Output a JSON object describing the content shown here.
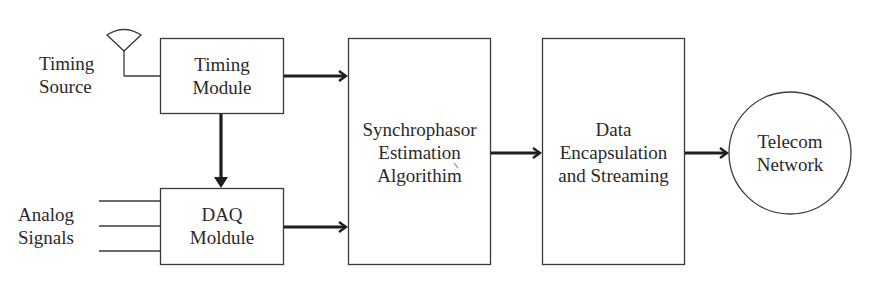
{
  "diagram": {
    "type": "block-diagram",
    "colors": {
      "line": "#3a3a3a",
      "arrow": "#1e1e1e",
      "text": "#2a2a2a",
      "background": "#ffffff"
    },
    "inputs": {
      "timing_source": {
        "lines": [
          "Timing",
          "Source"
        ],
        "icon": "antenna-icon"
      },
      "analog_signals": {
        "lines": [
          "Analog",
          "Signals"
        ],
        "signal_count": 3
      }
    },
    "blocks": {
      "timing_module": {
        "lines": [
          "Timing",
          "Module"
        ],
        "shape": "rectangle"
      },
      "daq_module": {
        "lines": [
          "DAQ",
          "Moldule"
        ],
        "shape": "rectangle"
      },
      "synchrophasor": {
        "lines": [
          "Synchrophasor",
          "Estimation",
          "Algorithim"
        ],
        "shape": "rectangle"
      },
      "data_encapsulation": {
        "lines": [
          "Data",
          "Encapsulation",
          "and Streaming"
        ],
        "shape": "rectangle"
      },
      "telecom_network": {
        "lines": [
          "Telecom",
          "Network"
        ],
        "shape": "circle"
      }
    },
    "connections": [
      {
        "from": "Timing Source",
        "to": "Timing Module",
        "style": "thin-line"
      },
      {
        "from": "Analog Signals",
        "to": "DAQ Moldule",
        "style": "thin-lines"
      },
      {
        "from": "Timing Module",
        "to": "DAQ Moldule",
        "style": "arrow"
      },
      {
        "from": "Timing Module",
        "to": "Synchrophasor Estimation Algorithim",
        "style": "arrow"
      },
      {
        "from": "DAQ Moldule",
        "to": "Synchrophasor Estimation Algorithim",
        "style": "arrow"
      },
      {
        "from": "Synchrophasor Estimation Algorithim",
        "to": "Data Encapsulation and Streaming",
        "style": "arrow"
      },
      {
        "from": "Data Encapsulation and Streaming",
        "to": "Telecom Network",
        "style": "arrow"
      }
    ]
  }
}
